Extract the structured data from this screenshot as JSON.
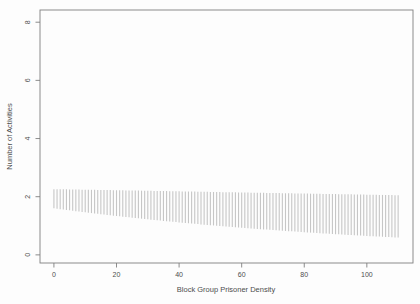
{
  "colors": {
    "background": "#fdfdfd",
    "axis_line": "#7f7f7f",
    "tick_text": "#4d4d4d",
    "interval_bar": "#c6c6c6"
  },
  "chart_data": {
    "type": "bar",
    "subtype": "vertical-interval-segments",
    "title": "",
    "xlabel": "Block Group Prisoner Density",
    "ylabel": "Number of Activities",
    "legend": "none",
    "grid": false,
    "xlim": [
      -4.45,
      114.75
    ],
    "ylim": [
      -0.28,
      8.42
    ],
    "x_ticks": [
      0,
      20,
      40,
      60,
      80,
      100
    ],
    "y_ticks": [
      0,
      2,
      4,
      6,
      8
    ],
    "x": [
      0,
      1,
      2,
      3,
      4,
      5,
      6,
      7,
      8,
      9,
      10,
      11,
      12,
      13,
      14,
      15,
      16,
      17,
      18,
      19,
      20,
      21,
      22,
      23,
      24,
      25,
      26,
      27,
      28,
      29,
      30,
      31,
      32,
      33,
      34,
      35,
      36,
      37,
      38,
      39,
      40,
      41,
      42,
      43,
      44,
      45,
      46,
      47,
      48,
      49,
      50,
      51,
      52,
      53,
      54,
      55,
      56,
      57,
      58,
      59,
      60,
      61,
      62,
      63,
      64,
      65,
      66,
      67,
      68,
      69,
      70,
      71,
      72,
      73,
      74,
      75,
      76,
      77,
      78,
      79,
      80,
      81,
      82,
      83,
      84,
      85,
      86,
      87,
      88,
      89,
      90,
      91,
      92,
      93,
      94,
      95,
      96,
      97,
      98,
      99,
      100,
      101,
      102,
      103,
      104,
      105,
      106,
      107,
      108,
      109,
      110
    ],
    "upper": [
      2.26,
      2.258,
      2.256,
      2.254,
      2.252,
      2.251,
      2.249,
      2.247,
      2.245,
      2.243,
      2.241,
      2.239,
      2.237,
      2.235,
      2.233,
      2.232,
      2.23,
      2.228,
      2.226,
      2.224,
      2.222,
      2.22,
      2.218,
      2.216,
      2.214,
      2.213,
      2.211,
      2.209,
      2.207,
      2.205,
      2.203,
      2.201,
      2.199,
      2.197,
      2.195,
      2.194,
      2.192,
      2.19,
      2.188,
      2.186,
      2.184,
      2.182,
      2.18,
      2.178,
      2.176,
      2.175,
      2.173,
      2.171,
      2.169,
      2.167,
      2.165,
      2.163,
      2.161,
      2.159,
      2.157,
      2.156,
      2.154,
      2.152,
      2.15,
      2.148,
      2.146,
      2.144,
      2.142,
      2.14,
      2.138,
      2.137,
      2.135,
      2.133,
      2.131,
      2.129,
      2.127,
      2.125,
      2.123,
      2.121,
      2.119,
      2.118,
      2.116,
      2.114,
      2.112,
      2.11,
      2.108,
      2.106,
      2.104,
      2.102,
      2.1,
      2.099,
      2.097,
      2.095,
      2.093,
      2.091,
      2.089,
      2.087,
      2.085,
      2.083,
      2.081,
      2.08,
      2.078,
      2.076,
      2.074,
      2.072,
      2.07,
      2.068,
      2.066,
      2.064,
      2.062,
      2.061,
      2.059,
      2.057,
      2.055,
      2.053,
      2.051
    ],
    "lower": [
      1.6,
      1.586,
      1.572,
      1.558,
      1.544,
      1.53,
      1.516,
      1.503,
      1.489,
      1.476,
      1.462,
      1.449,
      1.436,
      1.424,
      1.411,
      1.398,
      1.386,
      1.373,
      1.361,
      1.349,
      1.336,
      1.324,
      1.313,
      1.301,
      1.29,
      1.278,
      1.266,
      1.255,
      1.244,
      1.232,
      1.221,
      1.21,
      1.2,
      1.189,
      1.178,
      1.168,
      1.157,
      1.147,
      1.137,
      1.126,
      1.116,
      1.106,
      1.096,
      1.087,
      1.077,
      1.067,
      1.058,
      1.048,
      1.039,
      1.029,
      1.02,
      1.011,
      1.002,
      0.993,
      0.984,
      0.975,
      0.966,
      0.958,
      0.949,
      0.941,
      0.932,
      0.924,
      0.916,
      0.908,
      0.899,
      0.891,
      0.883,
      0.876,
      0.868,
      0.86,
      0.852,
      0.845,
      0.837,
      0.83,
      0.822,
      0.815,
      0.808,
      0.801,
      0.793,
      0.786,
      0.779,
      0.772,
      0.765,
      0.758,
      0.751,
      0.744,
      0.738,
      0.731,
      0.725,
      0.718,
      0.712,
      0.706,
      0.699,
      0.693,
      0.686,
      0.68,
      0.674,
      0.668,
      0.662,
      0.656,
      0.65,
      0.644,
      0.639,
      0.633,
      0.628,
      0.622,
      0.616,
      0.611,
      0.605,
      0.6,
      0.594
    ]
  }
}
